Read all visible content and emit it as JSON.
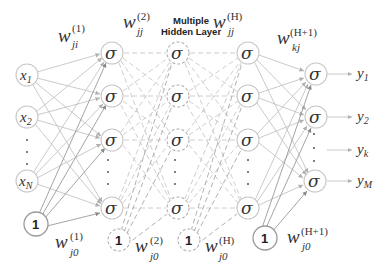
{
  "diagram": {
    "title_line1": "Multiple",
    "title_line2": "Hidden Layer",
    "activation_symbol": "σ",
    "bias_label": "1",
    "input_layer": {
      "nodes": [
        {
          "var": "x",
          "sub": "1"
        },
        {
          "var": "x",
          "sub": "2"
        },
        {
          "var": "x",
          "sub": "N"
        }
      ]
    },
    "output_layer": {
      "outputs": [
        {
          "var": "y",
          "sub": "1"
        },
        {
          "var": "y",
          "sub": "2"
        },
        {
          "var": "y",
          "sub": "k"
        },
        {
          "var": "y",
          "sub": "M"
        }
      ]
    },
    "weights": {
      "w1": {
        "base": "w",
        "sup": "(1)",
        "sub": "ji"
      },
      "w2": {
        "base": "w",
        "sup": "(2)",
        "sub": "jj"
      },
      "wH": {
        "base": "w",
        "sup": "(H)",
        "sub": "jj"
      },
      "wH1": {
        "base": "w",
        "sup": "(H+1)",
        "sub": "kj"
      },
      "w10": {
        "base": "w",
        "sup": "(1)",
        "sub": "j0"
      },
      "w20": {
        "base": "w",
        "sup": "(2)",
        "sub": "j0"
      },
      "wH0": {
        "base": "w",
        "sup": "(H)",
        "sub": "j0"
      },
      "wH10": {
        "base": "w",
        "sup": "(H+1)",
        "sub": "j0"
      }
    },
    "colors": {
      "edge": "#c4c4c4",
      "edge_dark": "#9a9a9a",
      "node_stroke": "#c8c8c8",
      "text": "#333333"
    }
  }
}
